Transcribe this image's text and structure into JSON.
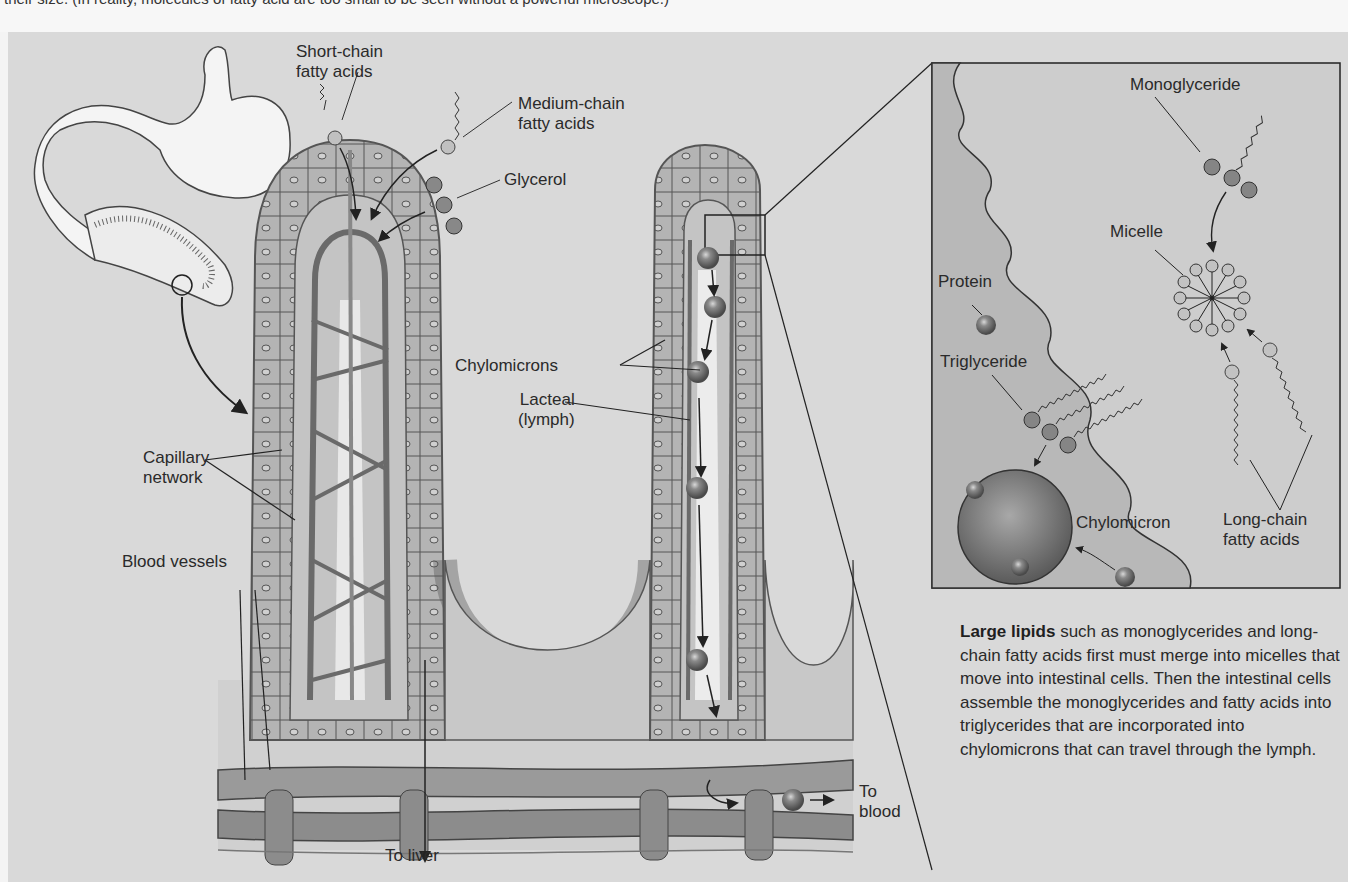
{
  "header": {
    "cut_caption": "their size. (In reality, molecules of fatty acid are too small to be seen without a powerful microscope.)"
  },
  "labels": {
    "short_chain": [
      "Short-chain",
      "fatty acids"
    ],
    "medium_chain": [
      "Medium-chain",
      "fatty acids"
    ],
    "glycerol": "Glycerol",
    "chylomicrons": "Chylomicrons",
    "lacteal": [
      "Lacteal",
      "(lymph)"
    ],
    "capillary": [
      "Capillary",
      "network"
    ],
    "blood_vessels": "Blood vessels",
    "to_liver": "To liver",
    "to_blood": [
      "To",
      "blood"
    ]
  },
  "inset": {
    "monoglyceride": "Monoglyceride",
    "micelle": "Micelle",
    "protein": "Protein",
    "triglyceride": "Triglyceride",
    "chylomicron": "Chylomicron",
    "long_chain": [
      "Long-chain",
      "fatty acids"
    ]
  },
  "caption": {
    "bold": "Large lipids",
    "rest": " such as monoglycerides and long-chain fatty acids first must merge into micelles that move into intestinal cells. Then the intestinal cells assemble the monoglycerides and fatty acids into triglycerides that are incorporated into chylomicrons that can travel through the lymph."
  },
  "colors": {
    "panel_bg": "#d9d9d9",
    "tissue": "#bdbdbd",
    "cell": "#b0b0b0",
    "vessel": "#8a8a8a",
    "molecule_light": "#bcbcbc",
    "molecule_dark": "#7d7d7d",
    "inset_bg": "#cfcfcf",
    "text": "#2a2a2a"
  }
}
